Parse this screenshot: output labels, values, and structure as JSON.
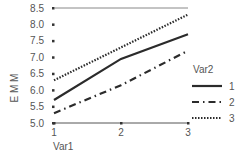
{
  "chart_data": {
    "type": "line",
    "title": "",
    "xlabel": "Var1",
    "ylabel": "E M M",
    "x": [
      1,
      2,
      3
    ],
    "x_tick_labels": [
      "1",
      "2",
      "3"
    ],
    "y_tick_labels": [
      "5.0",
      "5.5",
      "6.0",
      "6.5",
      "7.0",
      "7.5",
      "8.0",
      "8.5"
    ],
    "ylim": [
      5.0,
      8.5
    ],
    "grid": false,
    "legend_title": "Var2",
    "legend_position": "right",
    "series": [
      {
        "name": "1",
        "style": "solid",
        "values": [
          5.7,
          6.95,
          7.7
        ]
      },
      {
        "name": "2",
        "style": "dash-dot",
        "values": [
          5.3,
          6.15,
          7.2
        ]
      },
      {
        "name": "3",
        "style": "dotted",
        "values": [
          6.3,
          7.3,
          8.3
        ]
      }
    ]
  },
  "colors": {
    "lines": "#2b2b2b",
    "axis": "#555555",
    "text": "#555555"
  }
}
